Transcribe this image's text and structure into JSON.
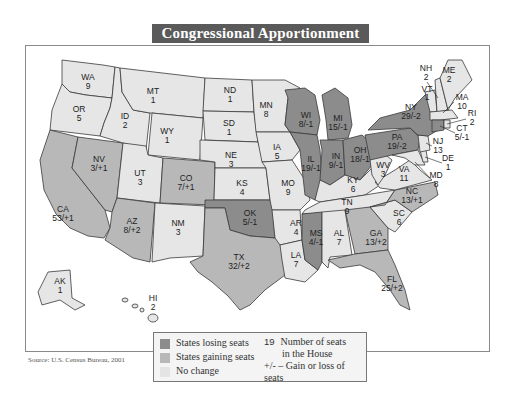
{
  "title": "Congressional Apportionment",
  "source": "Source: U.S. Census Bureau, 2001",
  "legend": {
    "losing": "States losing seats",
    "gaining": "States gaining seats",
    "no_change": "No change",
    "seats_number": "19",
    "seats_line1": "Number of seats",
    "seats_line2": "in the House",
    "change_symbol": "+/-",
    "change_text": "Gain or loss of seats"
  },
  "colors": {
    "losing": "#8c8c8c",
    "gaining": "#b8b8b8",
    "no_change": "#e6e6e6",
    "title_bg": "#5a5a5a"
  },
  "states": {
    "WA": {
      "abbr": "WA",
      "value": "9"
    },
    "OR": {
      "abbr": "OR",
      "value": "5"
    },
    "CA": {
      "abbr": "CA",
      "value": "53/+1"
    },
    "NV": {
      "abbr": "NV",
      "value": "3/+1"
    },
    "ID": {
      "abbr": "ID",
      "value": "2"
    },
    "MT": {
      "abbr": "MT",
      "value": "1"
    },
    "WY": {
      "abbr": "WY",
      "value": "1"
    },
    "UT": {
      "abbr": "UT",
      "value": "3"
    },
    "CO": {
      "abbr": "CO",
      "value": "7/+1"
    },
    "AZ": {
      "abbr": "AZ",
      "value": "8/+2"
    },
    "NM": {
      "abbr": "NM",
      "value": "3"
    },
    "ND": {
      "abbr": "ND",
      "value": "1"
    },
    "SD": {
      "abbr": "SD",
      "value": "1"
    },
    "NE": {
      "abbr": "NE",
      "value": "3"
    },
    "KS": {
      "abbr": "KS",
      "value": "4"
    },
    "OK": {
      "abbr": "OK",
      "value": "5/-1"
    },
    "TX": {
      "abbr": "TX",
      "value": "32/+2"
    },
    "MN": {
      "abbr": "MN",
      "value": "8"
    },
    "IA": {
      "abbr": "IA",
      "value": "5"
    },
    "MO": {
      "abbr": "MO",
      "value": "9"
    },
    "AR": {
      "abbr": "AR",
      "value": "4"
    },
    "LA": {
      "abbr": "LA",
      "value": "7"
    },
    "WI": {
      "abbr": "WI",
      "value": "8/-1"
    },
    "IL": {
      "abbr": "IL",
      "value": "19/-1"
    },
    "MI": {
      "abbr": "MI",
      "value": "15/-1"
    },
    "IN": {
      "abbr": "IN",
      "value": "9/-1"
    },
    "OH": {
      "abbr": "OH",
      "value": "18/-1"
    },
    "KY": {
      "abbr": "KY",
      "value": "6"
    },
    "TN": {
      "abbr": "TN",
      "value": "9"
    },
    "MS": {
      "abbr": "MS",
      "value": "4/-1"
    },
    "AL": {
      "abbr": "AL",
      "value": "7"
    },
    "GA": {
      "abbr": "GA",
      "value": "13/+2"
    },
    "FL": {
      "abbr": "FL",
      "value": "25/+2"
    },
    "SC": {
      "abbr": "SC",
      "value": "6"
    },
    "NC": {
      "abbr": "NC",
      "value": "13/+1"
    },
    "VA": {
      "abbr": "VA",
      "value": "11"
    },
    "WV": {
      "abbr": "WV",
      "value": "3"
    },
    "PA": {
      "abbr": "PA",
      "value": "19/-2"
    },
    "NY": {
      "abbr": "NY",
      "value": "29/-2"
    },
    "VT": {
      "abbr": "VT",
      "value": "1"
    },
    "NH": {
      "abbr": "NH",
      "value": "2"
    },
    "ME": {
      "abbr": "ME",
      "value": "2"
    },
    "MA": {
      "abbr": "MA",
      "value": "10"
    },
    "RI": {
      "abbr": "RI",
      "value": "2"
    },
    "CT": {
      "abbr": "CT",
      "value": "5/-1"
    },
    "NJ": {
      "abbr": "NJ",
      "value": "13"
    },
    "DE": {
      "abbr": "DE",
      "value": "1"
    },
    "MD": {
      "abbr": "MD",
      "value": "8"
    },
    "AK": {
      "abbr": "AK",
      "value": "1"
    },
    "HI": {
      "abbr": "HI",
      "value": "2"
    }
  }
}
